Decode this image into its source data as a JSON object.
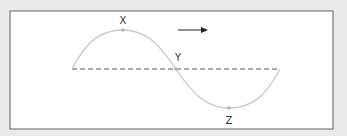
{
  "diagram": {
    "type": "transverse-wave",
    "labels": {
      "crest": "X",
      "equilibrium_crossing": "Y",
      "trough": "Z"
    },
    "direction_arrow": "right-arrow",
    "colors": {
      "background": "#ebebeb",
      "panel": "#ffffff",
      "panel_border": "#7a7a7a",
      "wave": "#c9c9c9",
      "points": "#b5b5b5",
      "dashed_axis": "#555555",
      "arrow": "#222222"
    }
  }
}
